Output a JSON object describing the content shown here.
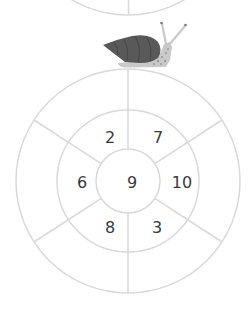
{
  "puzzle": {
    "center": "9",
    "cells": [
      {
        "position": "upper-left",
        "value": "2"
      },
      {
        "position": "upper-right",
        "value": "7"
      },
      {
        "position": "left",
        "value": "6"
      },
      {
        "position": "right",
        "value": "10"
      },
      {
        "position": "lower-left",
        "value": "8"
      },
      {
        "position": "lower-right",
        "value": "3"
      }
    ],
    "outer_ring_cells": [
      "",
      "",
      "",
      "",
      "",
      ""
    ]
  },
  "illustration": {
    "icon": "snail-icon",
    "colors": {
      "shell": "#595959",
      "body": "#c9c9c9",
      "spots": "#9a9a9a"
    }
  },
  "colors": {
    "lines": "#d9d9d9",
    "numbers": "#3a3a3a",
    "background": "#ffffff"
  }
}
